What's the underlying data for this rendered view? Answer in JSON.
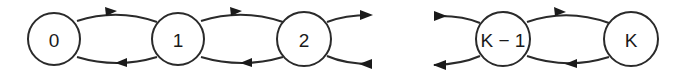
{
  "diagram": {
    "type": "birth-death chain / state transition diagram",
    "stroke_color": "#2a2a2a",
    "background": "#ffffff",
    "states": [
      {
        "id": "s0",
        "label": "0",
        "cx": 54,
        "cy": 39,
        "r": 26
      },
      {
        "id": "s1",
        "label": "1",
        "cx": 178,
        "cy": 39,
        "r": 26
      },
      {
        "id": "s2",
        "label": "2",
        "cx": 304,
        "cy": 39,
        "r": 27
      },
      {
        "id": "sK1",
        "label": "K − 1",
        "cx": 503,
        "cy": 39,
        "r": 27
      },
      {
        "id": "sK",
        "label": "K",
        "cx": 631,
        "cy": 39,
        "r": 27
      }
    ],
    "transitions": [
      {
        "from": "0",
        "to": "1",
        "direction": "forward"
      },
      {
        "from": "1",
        "to": "0",
        "direction": "backward"
      },
      {
        "from": "1",
        "to": "2",
        "direction": "forward"
      },
      {
        "from": "2",
        "to": "1",
        "direction": "backward"
      },
      {
        "from": "2",
        "to": "3",
        "direction": "forward",
        "truncated": true
      },
      {
        "from": "3",
        "to": "2",
        "direction": "backward",
        "truncated": true
      },
      {
        "from": "K-2",
        "to": "K-1",
        "direction": "forward",
        "truncated": true
      },
      {
        "from": "K-1",
        "to": "K-2",
        "direction": "backward",
        "truncated": true
      },
      {
        "from": "K-1",
        "to": "K",
        "direction": "forward"
      },
      {
        "from": "K",
        "to": "K-1",
        "direction": "backward"
      }
    ]
  }
}
